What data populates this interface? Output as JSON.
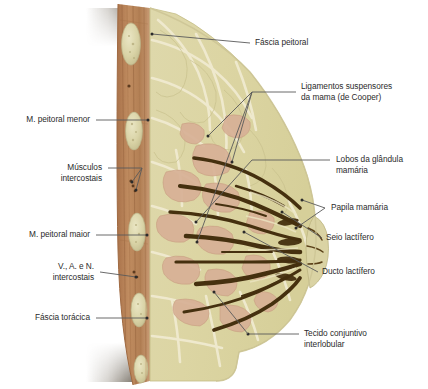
{
  "figure": {
    "type": "anatomical-cross-section",
    "background_color": "#ffffff",
    "palette": {
      "fat_tissue": "#d9d3a2",
      "fat_tissue_light": "#e4dfb6",
      "lobule_pink": "#d8b49a",
      "duct_dark": "#4a3418",
      "muscle_brown": "#b98258",
      "rib_pale": "#ded9b0",
      "skin_line": "#c9a37e",
      "septa_light": "#efe9c6",
      "shadow": "#6b5f4a",
      "leader_line": "#5a5a5a",
      "text": "#2b2b2b"
    }
  },
  "labels": {
    "right": [
      {
        "id": "fascia-peitoral",
        "text": "Fáscia peitoral"
      },
      {
        "id": "ligamentos-cooper",
        "text": "Ligamentos suspensores\nda mama (de Cooper)"
      },
      {
        "id": "lobos-glandula",
        "text": "Lobos da glândula\nmamária"
      },
      {
        "id": "papila-mamaria",
        "text": "Papila mamária"
      },
      {
        "id": "seio-lactifero",
        "text": "Seio lactífero"
      },
      {
        "id": "ducto-lactifero",
        "text": "Ducto lactífero"
      },
      {
        "id": "tecido-conjuntivo",
        "text": "Tecido conjuntivo\ninterlobular"
      }
    ],
    "left": [
      {
        "id": "m-peitoral-menor",
        "text": "M. peitoral menor"
      },
      {
        "id": "musculos-intercostais",
        "text": "Músculos\nintercostais"
      },
      {
        "id": "m-peitoral-maior",
        "text": "M. peitoral maior"
      },
      {
        "id": "van-intercostais",
        "text": "V., A. e N.\nintercostais"
      },
      {
        "id": "fascia-toracica",
        "text": "Fáscia torácica"
      }
    ]
  }
}
